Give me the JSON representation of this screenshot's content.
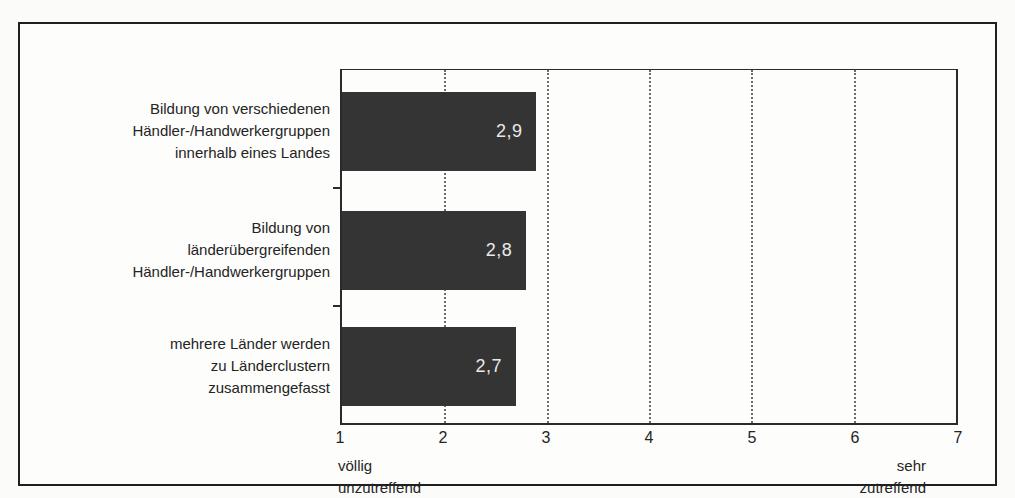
{
  "chart_data": {
    "type": "bar",
    "orientation": "horizontal",
    "title": "",
    "categories": [
      "Bildung von verschiedenen Händler-/Handwerkergruppen innerhalb eines Landes",
      "Bildung von länderübergreifenden Händler-/Handwerkergruppen",
      "mehrere Länder werden zu Länderclustern zusammengefasst"
    ],
    "categories_lines": [
      [
        "Bildung von verschiedenen",
        "Händler-/Handwerkergruppen",
        "innerhalb eines Landes"
      ],
      [
        "Bildung von",
        "länderübergreifenden",
        "Händler-/Handwerkergruppen"
      ],
      [
        "mehrere Länder werden",
        "zu Länderclustern",
        "zusammengefasst"
      ]
    ],
    "values": [
      2.9,
      2.8,
      2.7
    ],
    "value_labels": [
      "2,9",
      "2,8",
      "2,7"
    ],
    "xlim": [
      1,
      7
    ],
    "x_ticks": [
      1,
      2,
      3,
      4,
      5,
      6,
      7
    ],
    "x_tick_labels": [
      "1",
      "2",
      "3",
      "4",
      "5",
      "6",
      "7"
    ],
    "axis_min_caption_lines": [
      "völlig",
      "unzutreffend"
    ],
    "axis_max_caption_lines": [
      "sehr",
      "zutreffend"
    ],
    "grid": "vertical-dotted",
    "legend": "none",
    "colors": {
      "bar": "#343434",
      "value_label": "#e9e9e9",
      "frame_border": "#1f1f1f",
      "axis": "#2a2a2a",
      "grid": "#6b6b6b",
      "background": "#fdfdfc"
    }
  }
}
